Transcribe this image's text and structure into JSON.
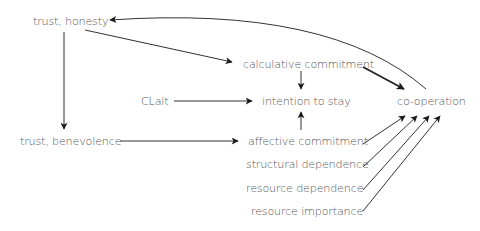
{
  "diagram": {
    "type": "flow",
    "nodes": [
      {
        "id": "trust_honesty",
        "label": "trust, honesty"
      },
      {
        "id": "trust_benevolence",
        "label": "trust, benevolence"
      },
      {
        "id": "clalt",
        "label": "CLalt"
      },
      {
        "id": "calculative_commitment",
        "label": "calculative commitment"
      },
      {
        "id": "intention_to_stay",
        "label": "intention to stay"
      },
      {
        "id": "affective_commitment",
        "label": "affective commitment"
      },
      {
        "id": "structural_dependence",
        "label": "structural dependence"
      },
      {
        "id": "resource_dependence",
        "label": "resource dependence"
      },
      {
        "id": "resource_importance",
        "label": "resource importance"
      },
      {
        "id": "co_operation",
        "label": "co-operation"
      }
    ],
    "edges": [
      {
        "from": "co_operation",
        "to": "trust_honesty",
        "style": "curved"
      },
      {
        "from": "trust_honesty",
        "to": "calculative_commitment",
        "style": "straight"
      },
      {
        "from": "trust_honesty",
        "to": "trust_benevolence",
        "style": "straight"
      },
      {
        "from": "trust_benevolence",
        "to": "affective_commitment",
        "style": "straight"
      },
      {
        "from": "clalt",
        "to": "intention_to_stay",
        "style": "straight"
      },
      {
        "from": "calculative_commitment",
        "to": "intention_to_stay",
        "style": "straight"
      },
      {
        "from": "affective_commitment",
        "to": "intention_to_stay",
        "style": "straight"
      },
      {
        "from": "calculative_commitment",
        "to": "co_operation",
        "style": "thick"
      },
      {
        "from": "affective_commitment",
        "to": "co_operation",
        "style": "straight"
      },
      {
        "from": "structural_dependence",
        "to": "co_operation",
        "style": "straight"
      },
      {
        "from": "resource_dependence",
        "to": "co_operation",
        "style": "straight"
      },
      {
        "from": "resource_importance",
        "to": "co_operation",
        "style": "straight"
      }
    ]
  }
}
